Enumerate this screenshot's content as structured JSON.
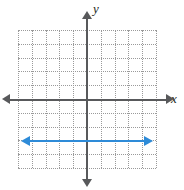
{
  "figure": {
    "axes": {
      "x_label": "x",
      "y_label": "y"
    }
  },
  "chart_data": {
    "type": "line",
    "title": "",
    "xlabel": "x",
    "ylabel": "y",
    "xlim": [
      -5,
      5
    ],
    "ylim": [
      -5,
      5
    ],
    "grid": true,
    "grid_style": "dotted",
    "grid_color": "#9a9a9a",
    "axis_color": "#58595b",
    "legend": "none",
    "series": [
      {
        "name": "y = -3",
        "color": "#2e8bd8",
        "equation": "y = -3",
        "arrows": "both",
        "x": [
          -5,
          5
        ],
        "values": [
          -3,
          -3
        ]
      }
    ]
  }
}
